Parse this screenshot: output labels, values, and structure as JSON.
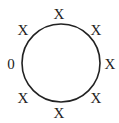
{
  "diagram": {
    "shape": "circle",
    "circle": {
      "cx": 61,
      "cy": 63,
      "r": 39,
      "stroke": "#222222",
      "stroke_width": 1.6
    },
    "labels": [
      {
        "position": "top",
        "text": "X",
        "x": 59,
        "y": 14
      },
      {
        "position": "top-right",
        "text": "X",
        "x": 96,
        "y": 30
      },
      {
        "position": "right",
        "text": "X",
        "x": 110,
        "y": 64
      },
      {
        "position": "bottom-right",
        "text": "X",
        "x": 96,
        "y": 98
      },
      {
        "position": "bottom",
        "text": "X",
        "x": 59,
        "y": 113
      },
      {
        "position": "bottom-left",
        "text": "X",
        "x": 23,
        "y": 98
      },
      {
        "position": "left",
        "text": "0",
        "x": 11,
        "y": 64
      },
      {
        "position": "top-left",
        "text": "X",
        "x": 23,
        "y": 30
      }
    ]
  }
}
